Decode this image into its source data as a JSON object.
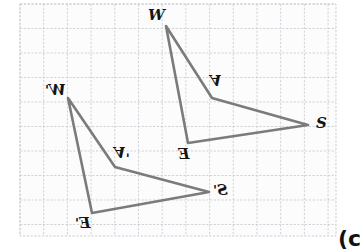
{
  "figure": {
    "caption": "(c",
    "caption_x": 338,
    "caption_y": 228,
    "background_color": "#ffffff",
    "stroke_color": "#7b7b7b",
    "grid_color": "#c9ccd4",
    "label_color": "#141414"
  },
  "grid": {
    "x0": 20,
    "y0": 4,
    "x1": 336,
    "y1": 236,
    "cell_w": 23.7,
    "cell_h": 24.5,
    "dashed": true
  },
  "shapes": [
    {
      "name": "quadrilateral-WASE",
      "closed": true,
      "points": [
        {
          "label": "W",
          "x": 166,
          "y": 26
        },
        {
          "label": "A",
          "x": 212,
          "y": 98
        },
        {
          "label": "S",
          "x": 308,
          "y": 125
        },
        {
          "label": "E",
          "x": 188,
          "y": 143
        }
      ]
    },
    {
      "name": "quadrilateral-WASE-prime",
      "closed": true,
      "points": [
        {
          "label": "W'",
          "x": 68,
          "y": 98
        },
        {
          "label": "A'",
          "x": 115,
          "y": 167
        },
        {
          "label": "S'",
          "x": 209,
          "y": 192
        },
        {
          "label": "E'",
          "x": 92,
          "y": 213
        }
      ]
    }
  ],
  "labels": [
    {
      "id": "label-W",
      "text": "W",
      "prime": "",
      "x": 148,
      "y": 8,
      "flip": "none",
      "shape": "WASE"
    },
    {
      "id": "label-A",
      "text": "A",
      "prime": "",
      "x": 210,
      "y": 72,
      "flip": "flip-v",
      "shape": "WASE"
    },
    {
      "id": "label-S",
      "text": "S",
      "prime": "",
      "x": 316,
      "y": 116,
      "flip": "none",
      "shape": "WASE"
    },
    {
      "id": "label-E",
      "text": "E",
      "prime": "",
      "x": 178,
      "y": 147,
      "flip": "flip-h",
      "shape": "WASE"
    },
    {
      "id": "label-W-prime",
      "text": "W",
      "prime": "'",
      "x": 45,
      "y": 83,
      "flip": "flip-h",
      "shape": "WASE-prime"
    },
    {
      "id": "label-A-prime",
      "text": "A",
      "prime": "'",
      "x": 114,
      "y": 144,
      "flip": "flip-v",
      "shape": "WASE-prime"
    },
    {
      "id": "label-S-prime",
      "text": "S",
      "prime": "'",
      "x": 213,
      "y": 183,
      "flip": "flip-h",
      "shape": "WASE-prime"
    },
    {
      "id": "label-E-prime",
      "text": "E",
      "prime": "'",
      "x": 75,
      "y": 216,
      "flip": "flip-h",
      "shape": "WASE-prime"
    }
  ]
}
